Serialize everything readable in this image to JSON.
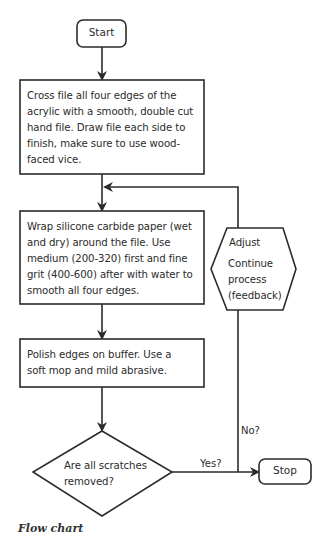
{
  "diagram": {
    "type": "flowchart",
    "nodes": {
      "start": {
        "label": "Start",
        "shape": "rounded-rectangle"
      },
      "step1": {
        "label": "Cross file all four edges of the acrylic with a smooth, double cut hand file. Draw file each side to finish, make sure to use wood-faced vice.",
        "shape": "rectangle"
      },
      "step2": {
        "label": "Wrap silicone carbide paper (wet and dry) around the file. Use medium (200-320) first and fine grit (400-600) after with water to smooth all four edges.",
        "shape": "rectangle"
      },
      "step3": {
        "label": "Polish edges on buffer. Use a soft mop and mild abrasive.",
        "shape": "rectangle"
      },
      "decision": {
        "label": "Are all scratches removed?",
        "shape": "diamond"
      },
      "adjust": {
        "title": "Adjust",
        "label": "Continue process (feedback)",
        "shape": "hexagon"
      },
      "stop": {
        "label": "Stop",
        "shape": "rounded-rectangle"
      }
    },
    "edges": {
      "yes_label": "Yes?",
      "no_label": "No?"
    },
    "caption": "Flow chart"
  },
  "colors": {
    "stroke": "#2b2b2b",
    "background": "#ffffff"
  }
}
